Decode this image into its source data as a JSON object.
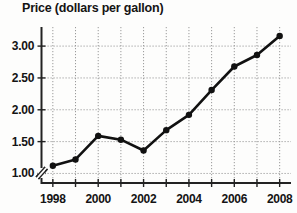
{
  "chart_data": {
    "type": "line",
    "title": "Price (dollars per gallon)",
    "xlabel": "",
    "ylabel": "",
    "x": [
      1998,
      1999,
      2000,
      2001,
      2002,
      2003,
      2004,
      2005,
      2006,
      2007,
      2008
    ],
    "values": [
      1.12,
      1.22,
      1.59,
      1.53,
      1.36,
      1.68,
      1.92,
      2.31,
      2.68,
      2.86,
      3.16
    ],
    "series": [
      {
        "name": "Price",
        "values": [
          1.12,
          1.22,
          1.59,
          1.53,
          1.36,
          1.68,
          1.92,
          2.31,
          2.68,
          2.86,
          3.16
        ]
      }
    ],
    "xlim": [
      1997.5,
      2008.5
    ],
    "ylim": [
      0.85,
      3.3
    ],
    "xticks": [
      1998,
      1999,
      2000,
      2001,
      2002,
      2003,
      2004,
      2005,
      2006,
      2007,
      2008
    ],
    "xtick_labels": [
      "1998",
      "",
      "2000",
      "",
      "2002",
      "",
      "2004",
      "",
      "2006",
      "",
      "2008"
    ],
    "yticks": [
      1.0,
      1.5,
      2.0,
      2.5,
      3.0
    ],
    "ytick_labels": [
      "1.00",
      "1.50",
      "2.00",
      "2.50",
      "3.00"
    ],
    "grid": true,
    "grid_style": "dotted",
    "legend": false,
    "legend_position": "none",
    "axis_break": true,
    "marker": "circle",
    "line_color": "#111111",
    "marker_color": "#111111",
    "grid_color": "#9a9a9a",
    "axis_color": "#222222",
    "background_color": "#fdfdfc"
  },
  "axes": {
    "y_labels": [
      "3.00",
      "2.50",
      "2.00",
      "1.50",
      "1.00"
    ],
    "x_labels": [
      "1998",
      "2000",
      "2002",
      "2004",
      "2006",
      "2008"
    ]
  }
}
